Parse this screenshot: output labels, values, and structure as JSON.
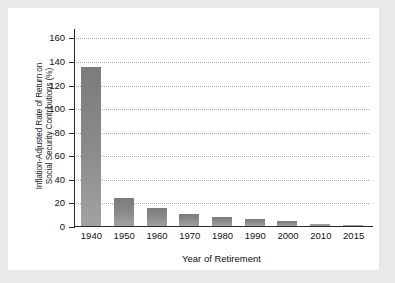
{
  "chart_data": {
    "type": "bar",
    "title": "",
    "xlabel": "Year of Retirement",
    "ylabel": "Inflation-Adjusted Rate of Return on Social Security Contributions (%)",
    "ylabel_line1": "Inflation-Adjusted Rate of Return on",
    "ylabel_line2": "Social Security Contributions (%)",
    "categories": [
      "1940",
      "1950",
      "1960",
      "1970",
      "1980",
      "1990",
      "2000",
      "2010",
      "2015"
    ],
    "values": [
      135,
      24,
      15,
      10,
      8,
      6,
      4,
      2,
      1
    ],
    "series": [
      {
        "name": "Inflation-Adjusted Rate of Return",
        "values": [
          135,
          24,
          15,
          10,
          8,
          6,
          4,
          2,
          1
        ]
      }
    ],
    "yticks": [
      0,
      20,
      40,
      60,
      80,
      100,
      120,
      140,
      160
    ],
    "ytick_labels": [
      "0",
      "20",
      "40",
      "60",
      "80",
      "100",
      "120",
      "140",
      "160"
    ],
    "ylim": [
      0,
      168
    ],
    "xlim_categories": 9,
    "grid": "horizontal-dotted",
    "legend": "none",
    "bar_color": "#848484",
    "grid_color": "#a9a9a9",
    "axis_color": "#2b2b2b",
    "panel_background": "#ffffff",
    "figure_background": "#e9e9e7"
  }
}
